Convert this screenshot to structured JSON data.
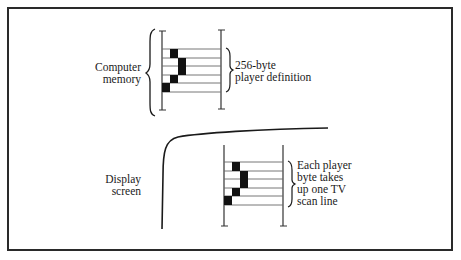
{
  "figure": {
    "memory_label": [
      "Computer",
      "memory"
    ],
    "definition_label": [
      "256-byte",
      "player definition"
    ],
    "screen_label": [
      "Display",
      "screen"
    ],
    "scanline_label": [
      "Each player",
      "byte takes",
      "up one TV",
      "scan line"
    ]
  },
  "memory_grid": {
    "rows": 5,
    "pixels": [
      {
        "row": 0,
        "col": 1
      },
      {
        "row": 1,
        "col": 2
      },
      {
        "row": 2,
        "col": 2
      },
      {
        "row": 3,
        "col": 1
      },
      {
        "row": 4,
        "col": 0
      }
    ]
  },
  "screen_grid": {
    "rows": 5,
    "pixels": [
      {
        "row": 0,
        "col": 1
      },
      {
        "row": 1,
        "col": 2
      },
      {
        "row": 2,
        "col": 2
      },
      {
        "row": 3,
        "col": 1
      },
      {
        "row": 4,
        "col": 0
      }
    ]
  },
  "colors": {
    "ink": "#1a1a1a",
    "line": "#555555",
    "frame": "#2a2a2a",
    "background": "#ffffff"
  }
}
